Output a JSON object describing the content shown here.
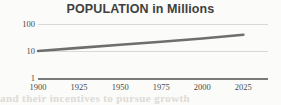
{
  "chart_data": {
    "type": "line",
    "title": "POPULATION in Millions",
    "xlabel": "",
    "ylabel": "",
    "yscale": "log",
    "ylim": [
      1,
      100
    ],
    "xlim": [
      1900,
      2040
    ],
    "grid": true,
    "legend": false,
    "y_ticks": [
      "100",
      "10",
      "1"
    ],
    "y_tick_values": [
      100,
      10,
      1
    ],
    "x_ticks": [
      "1900",
      "1925",
      "1950",
      "1975",
      "2000",
      "2025"
    ],
    "x_tick_values": [
      1900,
      1925,
      1950,
      1975,
      2000,
      2025
    ],
    "series": [
      {
        "name": "Population",
        "x": [
          1900,
          1925,
          1950,
          1975,
          2000,
          2025
        ],
        "values": [
          10,
          13,
          17,
          22,
          29,
          40
        ],
        "color": "#6e6e6e"
      }
    ]
  },
  "figure": {
    "title": "POPULATION in Millions",
    "background_color": "#fbfbf9",
    "title_color": "#3f3f3f",
    "gridline_color": "#d8d8d8",
    "axis_color": "#7a7a7a",
    "tick_label_color": "#4a4a4a",
    "line_color": "#6e6e6e"
  },
  "y_axis": {
    "ticks": [
      {
        "label": "100",
        "value": 100
      },
      {
        "label": "10",
        "value": 10
      },
      {
        "label": "1",
        "value": 1
      }
    ]
  },
  "x_axis": {
    "ticks": [
      {
        "label": "1900",
        "value": 1900
      },
      {
        "label": "1925",
        "value": 1925
      },
      {
        "label": "1950",
        "value": 1950
      },
      {
        "label": "1975",
        "value": 1975
      },
      {
        "label": "2000",
        "value": 2000
      },
      {
        "label": "2025",
        "value": 2025
      }
    ]
  },
  "artifacts": {
    "bleed_through_text": "and their incentives to pursue growth"
  }
}
